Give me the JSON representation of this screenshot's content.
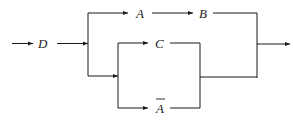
{
  "diagram": {
    "type": "reliability-block-diagram",
    "colors": {
      "line": "#1a1a1a",
      "background": "#ffffff"
    },
    "nodes": {
      "D": {
        "label": "D",
        "overline": false
      },
      "A": {
        "label": "A",
        "overline": false
      },
      "B": {
        "label": "B",
        "overline": false
      },
      "C": {
        "label": "C",
        "overline": false
      },
      "not_A": {
        "label": "A",
        "overline": true
      }
    },
    "connections": [
      "input -> D",
      "D -> A",
      "A -> B",
      "D -> C",
      "D -> not_A",
      "C -> merge",
      "not_A -> merge",
      "B -> output",
      "merge -> output"
    ]
  }
}
